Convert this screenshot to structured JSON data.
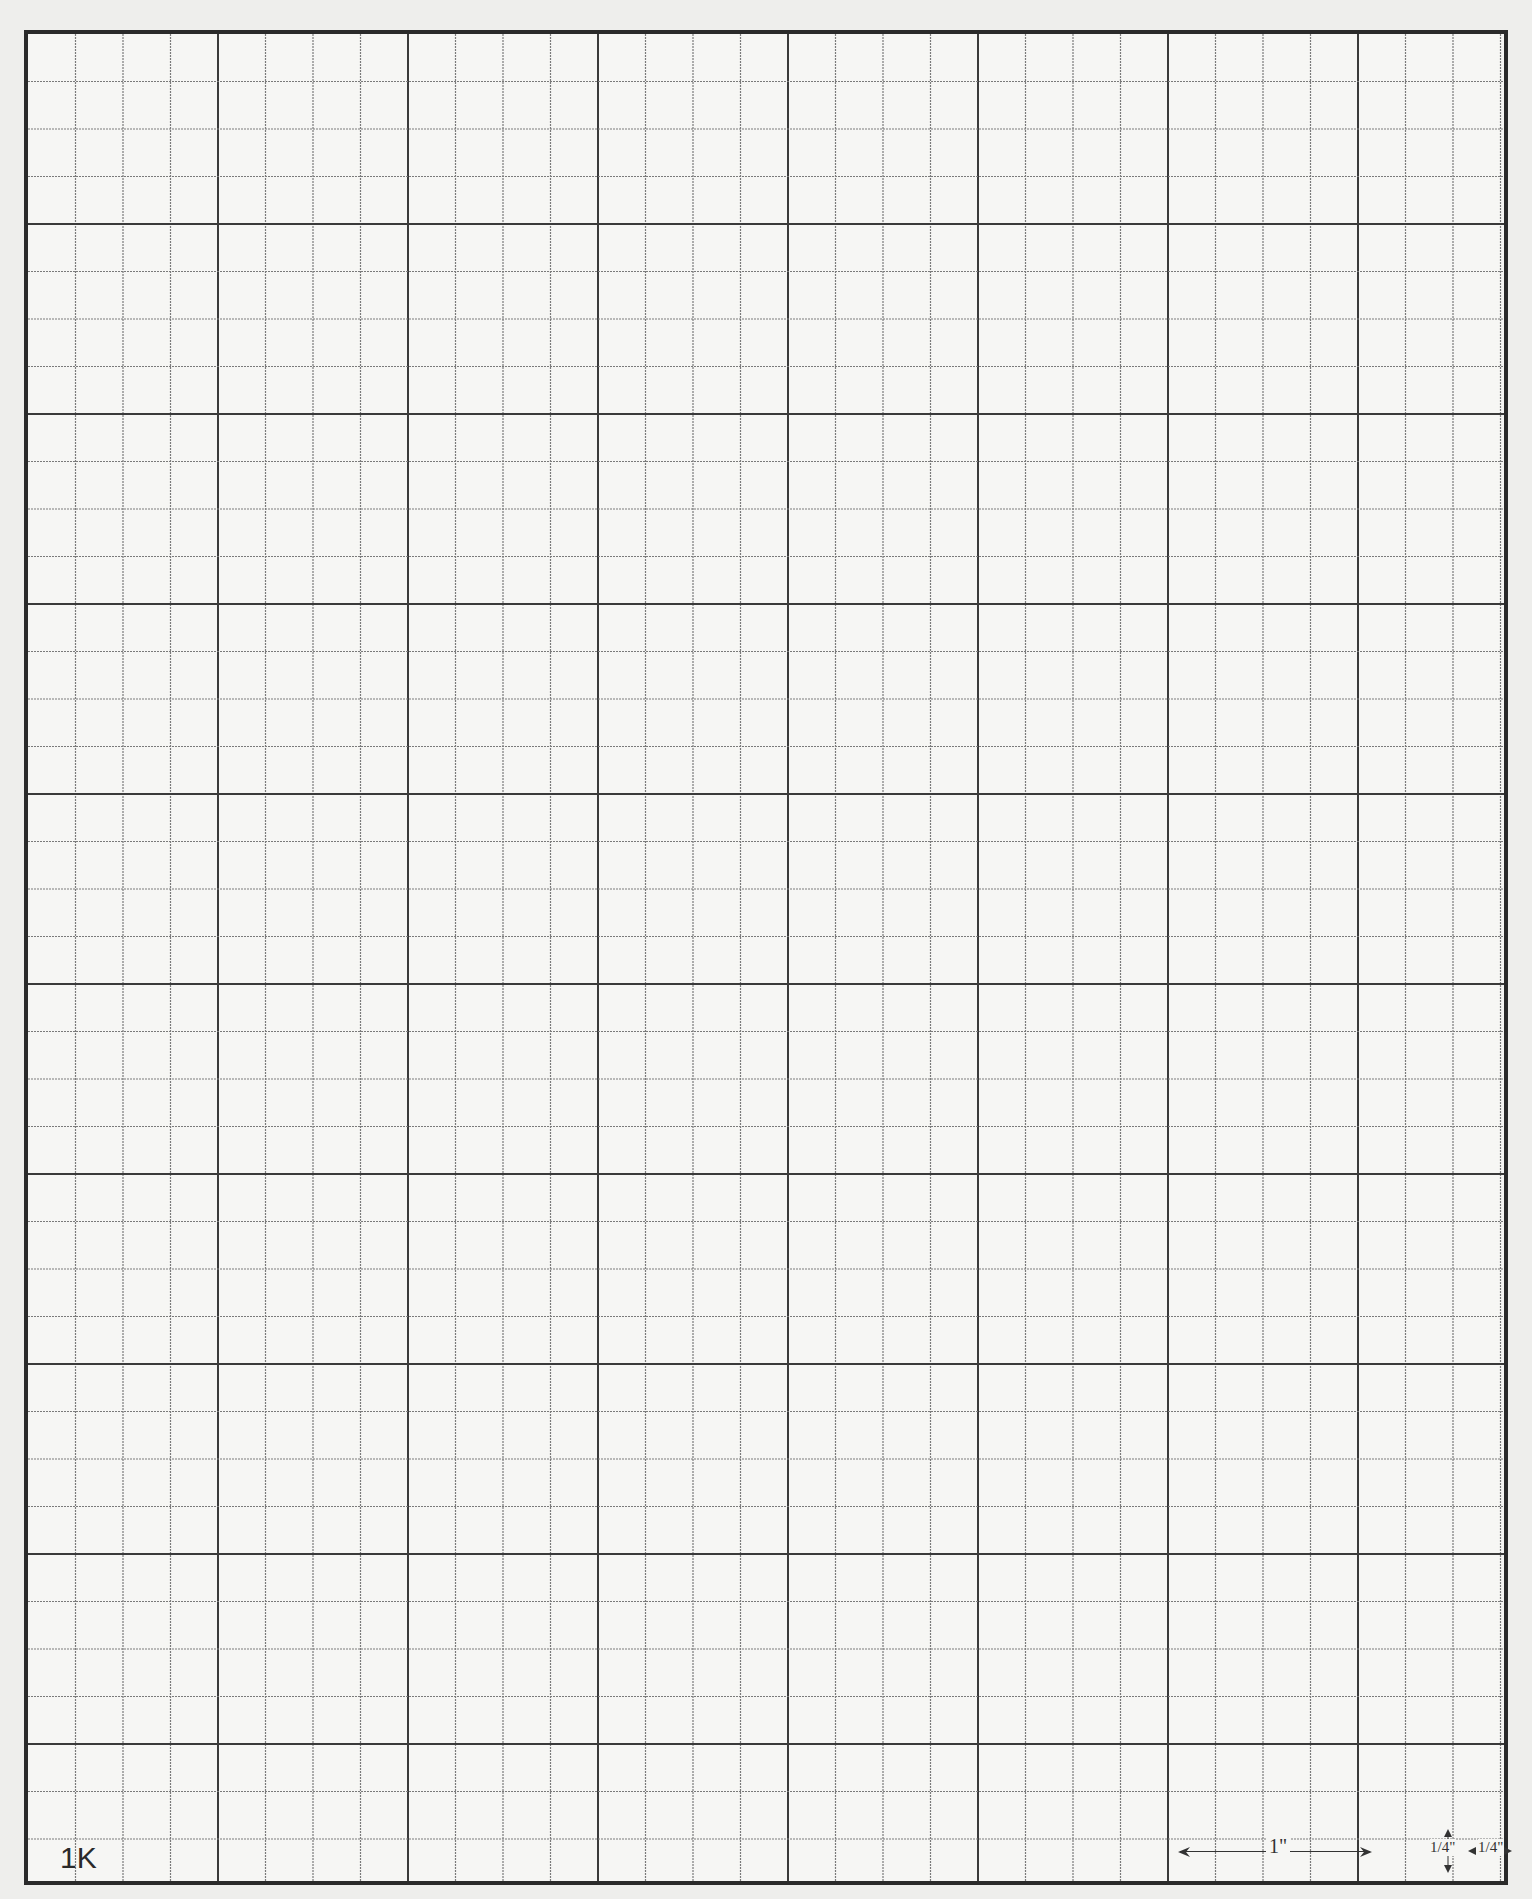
{
  "page": {
    "type": "graph-paper",
    "paper_id_label": "1K",
    "colors": {
      "paper": "#f6f6f4",
      "grid_minor": "#7a7a7a",
      "grid_major": "#3a3a3a",
      "border": "#2a2a2a"
    }
  },
  "grid": {
    "cell_px": 47.5,
    "cells_per_major": 4,
    "columns": 31,
    "rows": 39
  },
  "scale": {
    "inch_label": "1\"",
    "quarter_vertical_label": "1/4\"",
    "quarter_horizontal_label": "1/4\"",
    "quarter_num": "1",
    "quarter_den": "4",
    "quarter_mark": "\""
  }
}
